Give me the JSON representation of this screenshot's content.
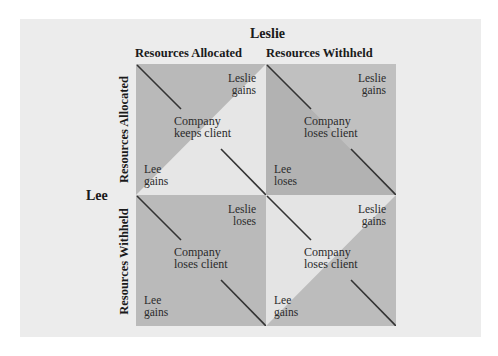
{
  "diagram": {
    "column_player": "Leslie",
    "row_player": "Lee",
    "column_strategies": [
      "Resources Allocated",
      "Resources Withheld"
    ],
    "row_strategies": [
      "Resources Allocated",
      "Resources Withheld"
    ],
    "colors": {
      "panel_bg": "#ececec",
      "light": "#e6e6e6",
      "dark": "#b8b8b8",
      "dark_alt": "#c0c0c0",
      "darker": "#b2b2b2",
      "line": "#333333"
    },
    "cells": [
      {
        "row": "Resources Allocated",
        "col": "Resources Allocated",
        "leslie": [
          "Leslie",
          "gains"
        ],
        "company": [
          "Company",
          "keeps client"
        ],
        "lee": [
          "Lee",
          "gains"
        ]
      },
      {
        "row": "Resources Allocated",
        "col": "Resources Withheld",
        "leslie": [
          "Leslie",
          "gains"
        ],
        "company": [
          "Company",
          "loses client"
        ],
        "lee": [
          "Lee",
          "loses"
        ]
      },
      {
        "row": "Resources Withheld",
        "col": "Resources Allocated",
        "leslie": [
          "Leslie",
          "loses"
        ],
        "company": [
          "Company",
          "loses client"
        ],
        "lee": [
          "Lee",
          "gains"
        ]
      },
      {
        "row": "Resources Withheld",
        "col": "Resources Withheld",
        "leslie": [
          "Leslie",
          "gains"
        ],
        "company": [
          "Company",
          "loses client"
        ],
        "lee": [
          "Lee",
          "gains"
        ]
      }
    ]
  }
}
